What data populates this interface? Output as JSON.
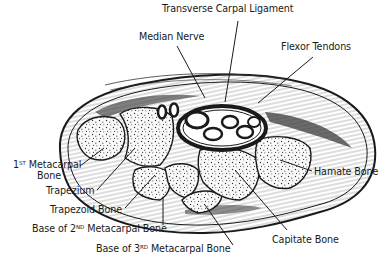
{
  "diagram": {
    "colors": {
      "ink": "#1a1a1a",
      "background": "#ffffff",
      "bone_fill": "#f4f4f4",
      "shading": "#555555"
    },
    "labels": {
      "transverse_carpal_ligament": "Transverse Carpal Ligament",
      "median_nerve": "Median Nerve",
      "flexor_tendons": "Flexor Tendons",
      "first_metacarpal": {
        "prefix": "1",
        "sup": "ST",
        "line1_rest": " Metacarpal",
        "line2": "Bone"
      },
      "hamate_bone": "Hamate Bone",
      "trapezium": "Trapezium",
      "trapezoid_bone": "Trapezoid Bone",
      "base_2nd_metacarpal": {
        "prefix": "Base of 2",
        "sup": "ND",
        "rest": " Metacarpal Bone"
      },
      "capitate_bone": "Capitate Bone",
      "base_3rd_metacarpal": {
        "prefix": "Base of 3",
        "sup": "RD",
        "rest": " Metacarpal Bone"
      }
    }
  }
}
